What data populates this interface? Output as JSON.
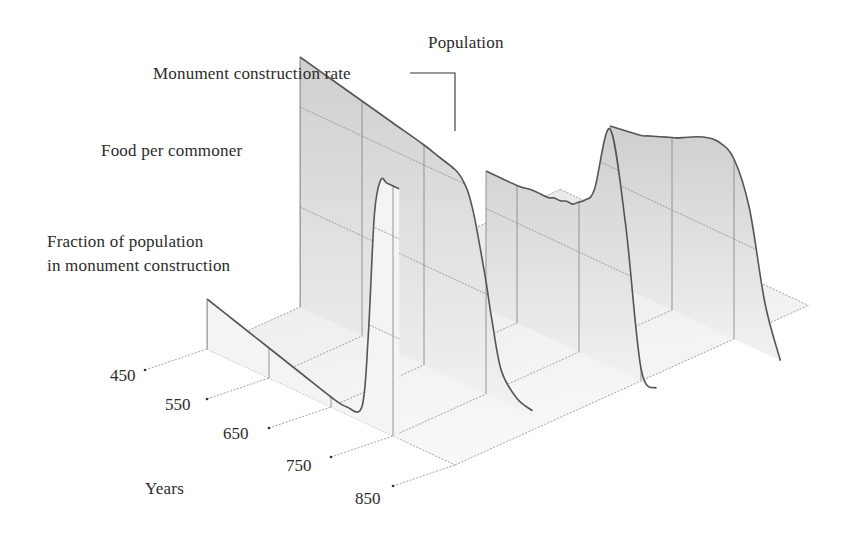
{
  "chart_data": {
    "type": "area",
    "subtype": "3d-ribbon",
    "title": "",
    "xlabel": "Years",
    "x_ticks": [
      450,
      550,
      650,
      750,
      850
    ],
    "x": [
      450,
      500,
      550,
      600,
      650,
      675,
      700,
      710,
      720,
      730,
      740,
      750,
      760,
      775,
      800,
      825,
      850,
      875,
      900,
      925
    ],
    "series": [
      {
        "name": "Fraction of population in monument construction",
        "depth": 0,
        "values": [
          0.2,
          0.16,
          0.12,
          0.08,
          0.04,
          0.03,
          0.06,
          0.35,
          0.85,
          1.0,
          1.0,
          1.0,
          1.0,
          null,
          null,
          null,
          null,
          null,
          null,
          null
        ]
      },
      {
        "name": "Food per commoner",
        "depth": 1,
        "values": [
          1.0,
          0.97,
          0.94,
          0.91,
          0.88,
          0.86,
          0.84,
          0.82,
          0.78,
          0.7,
          0.58,
          0.45,
          0.3,
          0.12,
          0.04,
          0.02,
          null,
          null,
          null,
          null
        ]
      },
      {
        "name": "Monument construction rate",
        "depth": 2,
        "values": [
          null,
          null,
          null,
          0.55,
          0.55,
          0.56,
          0.56,
          0.57,
          0.57,
          0.58,
          0.58,
          0.6,
          0.62,
          0.68,
          0.95,
          0.6,
          0.05,
          0.0,
          null,
          null
        ]
      },
      {
        "name": "Population",
        "depth": 3,
        "values": [
          null,
          null,
          null,
          null,
          0.62,
          0.63,
          0.64,
          0.65,
          0.66,
          0.67,
          0.68,
          0.69,
          0.7,
          0.72,
          0.75,
          0.76,
          0.72,
          0.55,
          0.2,
          0.0
        ]
      }
    ],
    "legend": "labels placed directly beside each wall",
    "grid": true
  },
  "labels": {
    "population": "Population",
    "monument_rate": "Monument construction rate",
    "food": "Food per commoner",
    "fraction_line1": "Fraction of population",
    "fraction_line2": "in monument construction",
    "years": "Years",
    "tick_450": "450",
    "tick_550": "550",
    "tick_650": "650",
    "tick_750": "750",
    "tick_850": "850"
  },
  "colors": {
    "ink": "#555555",
    "grid": "#8a8a8a",
    "wall_fill": "#e4e4e4",
    "wall_fill_dark": "#cfcfcf",
    "floor": "#ececec"
  }
}
